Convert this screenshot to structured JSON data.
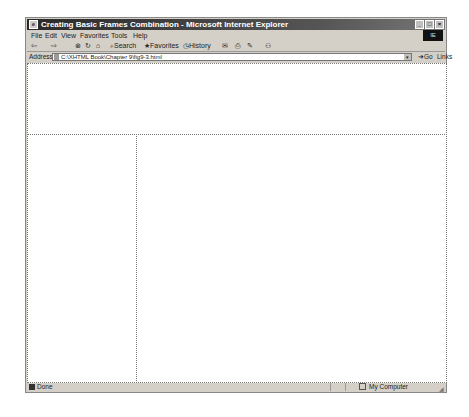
{
  "window": {
    "title": "Creating Basic Frames Combination - Microsoft Internet Explorer",
    "controls": [
      "_",
      "□",
      "×"
    ]
  },
  "menubar": {
    "items": [
      "File",
      "Edit",
      "View",
      "Favorites",
      "Tools",
      "Help"
    ],
    "throbber": "IE"
  },
  "toolbar": {
    "back": "⇦",
    "forward": "⇨",
    "stop": "⊗",
    "refresh": "↻",
    "home": "⌂",
    "search": "Search",
    "favorites": "Favorites",
    "history": "History",
    "mail": "✉",
    "print": "⎙",
    "edit": "✎",
    "discuss": "⚇"
  },
  "addressbar": {
    "label": "Address",
    "value": "C:\\XHTML Book\\Chapter 9\\fig9-3.html",
    "go": "Go",
    "links": "Links »"
  },
  "statusbar": {
    "status": "Done",
    "zone": "My Computer"
  }
}
